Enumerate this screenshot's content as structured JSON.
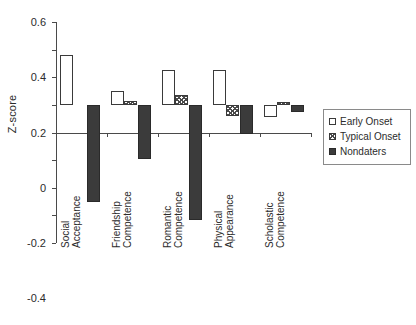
{
  "chart_data": {
    "type": "bar",
    "title": "",
    "subtitle": "",
    "xlabel": "",
    "ylabel": "Z-score",
    "ylim": [
      -1,
      0.6
    ],
    "yticks": [
      0.6,
      0.4,
      0.2,
      0,
      -0.2,
      -0.4,
      -0.6,
      -0.8,
      -1
    ],
    "ytick_labels": [
      "0.6",
      "0.4",
      "0.2",
      "0",
      "-0.2",
      "-0.4",
      "-0.6",
      "-0.8",
      "-1"
    ],
    "grid": false,
    "legend_position": "right",
    "categories": [
      "Social Acceptance",
      "Friendship Competence",
      "Romantic Competence",
      "Physical Appearance",
      "Scholastic Competence"
    ],
    "category_lines": [
      [
        "Social",
        "Acceptance"
      ],
      [
        "Friendship",
        "Competence"
      ],
      [
        "Romantic",
        "Competence"
      ],
      [
        "Physical",
        "Appearance"
      ],
      [
        "Scholastic",
        "Competence"
      ]
    ],
    "series": [
      {
        "name": "Early Onset",
        "fill": "white",
        "values": [
          0.36,
          0.1,
          0.25,
          0.25,
          -0.09
        ]
      },
      {
        "name": "Typical Onset",
        "fill": "hatched",
        "values": [
          null,
          0.025,
          0.075,
          -0.08,
          0.02
        ]
      },
      {
        "name": "Nondaters",
        "fill": "dark",
        "values": [
          -0.7,
          -0.39,
          -0.83,
          -0.21,
          -0.05
        ]
      }
    ]
  },
  "legend": {
    "items": [
      {
        "label": "Early Onset",
        "swatch": "white-square-swatch"
      },
      {
        "label": "Typical Onset",
        "swatch": "hatched-square-swatch"
      },
      {
        "label": "Nondaters",
        "swatch": "dark-square-swatch"
      }
    ]
  },
  "colors": {
    "early_onset": "#ffffff",
    "typical_onset": "#4a4a4a",
    "nondaters": "#3b3b3b",
    "axis": "#4a4a4a",
    "text": "#2b2b2b"
  }
}
